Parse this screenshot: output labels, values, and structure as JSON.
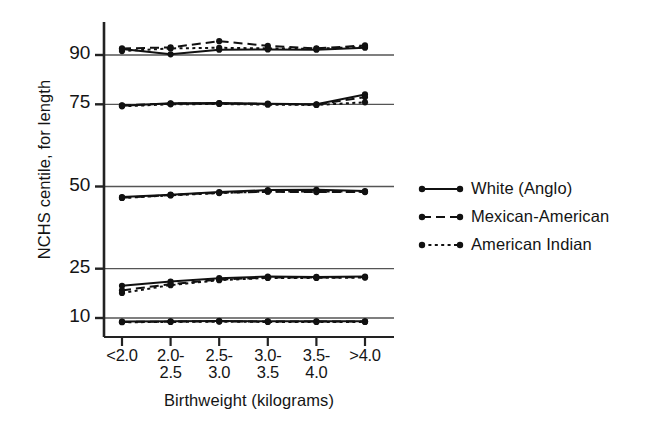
{
  "chart_data": {
    "type": "line",
    "title": "",
    "xlabel": "Birthweight  (kilograms)",
    "ylabel": "NCHS centile, for length",
    "categories": [
      "<2.0",
      "2.0-\n2.5",
      "2.5-\n3.0",
      "3.0-\n3.5",
      "3.5-\n4.0",
      ">4.0"
    ],
    "category_labels": [
      {
        "line1": "<2.0",
        "line2": ""
      },
      {
        "line1": "2.0-",
        "line2": "2.5"
      },
      {
        "line1": "2.5-",
        "line2": "3.0"
      },
      {
        "line1": "3.0-",
        "line2": "3.5"
      },
      {
        "line1": "3.5-",
        "line2": "4.0"
      },
      {
        "line1": ">4.0",
        "line2": ""
      }
    ],
    "ytick_labels": [
      "90",
      "75",
      "50",
      "25",
      "10"
    ],
    "ytick_values": [
      90,
      75,
      50,
      25,
      10
    ],
    "ylim": [
      0,
      100
    ],
    "grid": "horizontal",
    "legend_position": "right",
    "bands": [
      {
        "band": "90th centile",
        "series": [
          {
            "name": "White (Anglo)",
            "style": "solid",
            "values": [
              91.8,
              90.2,
              91.6,
              91.7,
              91.6,
              92.2
            ]
          },
          {
            "name": "Mexican-American",
            "style": "dashed",
            "values": [
              92.0,
              92.3,
              94.2,
              92.8,
              92.0,
              92.9
            ]
          },
          {
            "name": "American Indian",
            "style": "dotted",
            "values": [
              91.2,
              92.0,
              92.2,
              92.0,
              91.9,
              92.5
            ]
          }
        ]
      },
      {
        "band": "75th centile",
        "series": [
          {
            "name": "White (Anglo)",
            "style": "solid",
            "values": [
              74.6,
              75.3,
              75.4,
              75.2,
              75.0,
              78.0
            ]
          },
          {
            "name": "Mexican-American",
            "style": "dashed",
            "values": [
              74.7,
              75.2,
              75.3,
              75.1,
              74.9,
              77.2
            ]
          },
          {
            "name": "American Indian",
            "style": "dotted",
            "values": [
              74.4,
              75.0,
              75.1,
              74.9,
              74.8,
              75.6
            ]
          }
        ]
      },
      {
        "band": "50th centile",
        "series": [
          {
            "name": "White (Anglo)",
            "style": "solid",
            "values": [
              46.8,
              47.5,
              48.3,
              48.9,
              49.0,
              48.6
            ]
          },
          {
            "name": "Mexican-American",
            "style": "dashed",
            "values": [
              46.6,
              47.4,
              48.1,
              48.4,
              48.3,
              48.3
            ]
          },
          {
            "name": "American Indian",
            "style": "dotted",
            "values": [
              46.5,
              47.3,
              48.0,
              48.5,
              48.5,
              48.4
            ]
          }
        ]
      },
      {
        "band": "25th centile",
        "series": [
          {
            "name": "White (Anglo)",
            "style": "solid",
            "values": [
              19.8,
              21.1,
              22.1,
              22.6,
              22.5,
              22.6
            ]
          },
          {
            "name": "Mexican-American",
            "style": "dashed",
            "values": [
              18.4,
              20.3,
              21.7,
              22.3,
              22.3,
              22.4
            ]
          },
          {
            "name": "American Indian",
            "style": "dotted",
            "values": [
              17.6,
              20.0,
              21.5,
              22.2,
              22.2,
              22.3
            ]
          }
        ]
      },
      {
        "band": "10th centile",
        "series": [
          {
            "name": "White (Anglo)",
            "style": "solid",
            "values": [
              8.9,
              9.0,
              9.1,
              9.0,
              9.0,
              9.0
            ]
          },
          {
            "name": "Mexican-American",
            "style": "dashed",
            "values": [
              8.8,
              8.9,
              9.0,
              8.9,
              8.9,
              8.9
            ]
          },
          {
            "name": "American Indian",
            "style": "dotted",
            "values": [
              8.7,
              8.8,
              8.9,
              8.8,
              8.8,
              8.8
            ]
          }
        ]
      }
    ],
    "legend": [
      {
        "label": "White (Anglo)",
        "style": "solid"
      },
      {
        "label": "Mexican-American",
        "style": "dashed"
      },
      {
        "label": "American Indian",
        "style": "dotted"
      }
    ],
    "colors": {
      "line": "#111111",
      "axis": "#222222",
      "grid": "#555555",
      "background": "#ffffff"
    }
  }
}
